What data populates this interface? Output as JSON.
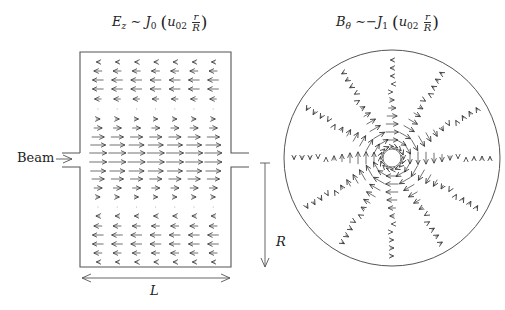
{
  "left_panel": {
    "title": {
      "field": "E",
      "field_sub": "z",
      "sim": "∼",
      "bessel": "J",
      "bessel_sub": "0",
      "arg_u": "u",
      "arg_u_sub": "02",
      "frac_num": "r",
      "frac_den": "R"
    },
    "beam_label": "Beam",
    "length_label": "L",
    "radius_label": "R",
    "box": {
      "x": 80,
      "y": 52,
      "w": 151,
      "h": 215
    },
    "port": {
      "y_top": 153,
      "y_bot": 167,
      "ext": 18
    },
    "grid": {
      "cols": 7,
      "x_start": 98,
      "x_step": 19.2,
      "rows_y": [
        62,
        71,
        80,
        89,
        99,
        109,
        119,
        128,
        137,
        145,
        153,
        162,
        171,
        179,
        188,
        197,
        207,
        216,
        226,
        235,
        244,
        253,
        262
      ],
      "row_values": [
        -0.25,
        -0.6,
        -0.8,
        -0.8,
        -0.5,
        0.05,
        0.3,
        0.6,
        0.9,
        1.1,
        1.25,
        1.25,
        1.1,
        0.9,
        0.6,
        0.3,
        0.05,
        -0.3,
        -0.6,
        -0.8,
        -0.8,
        -0.6,
        -0.25
      ]
    },
    "length_arrow": {
      "x1": 82,
      "x2": 230,
      "y": 278
    },
    "radius_arrow": {
      "x": 265,
      "y1": 163,
      "y2": 267
    }
  },
  "right_panel": {
    "title": {
      "field": "B",
      "field_sub": "θ",
      "sim": "∼",
      "neg": "−",
      "bessel": "J",
      "bessel_sub": "1",
      "arg_u": "u",
      "arg_u_sub": "02",
      "frac_num": "r",
      "frac_den": "R"
    },
    "circle": {
      "cx": 392,
      "cy": 158,
      "r": 108
    },
    "inner_ring_r": 9,
    "spokes": 12,
    "radii": [
      18,
      26,
      34,
      42,
      50,
      58,
      66,
      74,
      82,
      90,
      98
    ],
    "values": [
      0.9,
      1.0,
      0.95,
      0.8,
      0.6,
      0.35,
      0.1,
      -0.1,
      -0.25,
      -0.3,
      -0.25
    ]
  },
  "colors": {
    "stroke": "#555555",
    "arrow": "#333333",
    "text": "#222222"
  }
}
